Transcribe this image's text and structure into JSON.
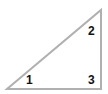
{
  "diagram": {
    "shape": "right-triangle",
    "stroke_color": "#b0b0b0",
    "label_color": "#111111",
    "vertices": [
      {
        "id": "1",
        "label": "1",
        "x": 7,
        "y": 89
      },
      {
        "id": "2",
        "label": "2",
        "x": 101,
        "y": 10
      },
      {
        "id": "3",
        "label": "3",
        "x": 101,
        "y": 89
      }
    ]
  }
}
